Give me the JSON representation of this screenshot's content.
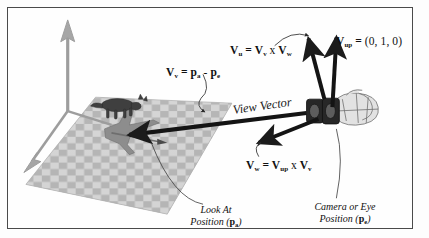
{
  "figure": {
    "kind": "camera-view-vector-diagram",
    "background": "#fefefe",
    "border_color": "#4a4a4a"
  },
  "labels": {
    "v_u": {
      "lhs": "V",
      "lhs_sub": "u",
      "eq": "=",
      "rhs1": "V",
      "rhs1_sub": "v",
      "op": "x",
      "rhs2": "V",
      "rhs2_sub": "w",
      "text": "Vu = Vv x Vw"
    },
    "v_up": {
      "lhs": "V",
      "lhs_sub": "up",
      "eq": "=",
      "value": "(0, 1, 0)",
      "text": "Vup = (0, 1, 0)"
    },
    "v_v": {
      "lhs": "V",
      "lhs_sub": "v",
      "eq": "=",
      "rhs1": "p",
      "rhs1_sub": "a",
      "op": "-",
      "rhs2": "p",
      "rhs2_sub": "e",
      "text": "Vv = pa - pe"
    },
    "v_w": {
      "lhs": "V",
      "lhs_sub": "w",
      "eq": "=",
      "rhs1": "V",
      "rhs1_sub": "up",
      "op": "x",
      "rhs2": "V",
      "rhs2_sub": "v",
      "text": "Vw = Vup x Vv"
    },
    "view_vector": "View Vector"
  },
  "captions": {
    "look_at": {
      "line1": "Look At",
      "line2_pre": "Position (",
      "symbol": "p",
      "symbol_sub": "a",
      "line2_post": ")"
    },
    "eye": {
      "line1": "Camera or Eye",
      "line2_pre": "Position (",
      "symbol": "p",
      "symbol_sub": "e",
      "line2_post": ")"
    }
  },
  "scene": {
    "ground": {
      "name": "checkerboard-ground-plane",
      "light": "#d4d4d4",
      "dark": "#b3b3b3"
    },
    "axes": {
      "name": "coordinate-axes",
      "color": "#9a9a9a",
      "count": 3
    },
    "objects": [
      {
        "name": "cat-figure",
        "color": "#4a4a4a"
      },
      {
        "name": "airplane-figure",
        "color": "#8a8a8a"
      },
      {
        "name": "camera-figure",
        "color": "#2e2e2e"
      }
    ],
    "vectors": [
      {
        "name": "view-vector-arrow",
        "label": "V_v",
        "color": "#1b1b1b"
      },
      {
        "name": "v-up-arrow",
        "label": "V_up",
        "color": "#1b1b1b"
      },
      {
        "name": "v-u-arrow",
        "label": "V_u",
        "color": "#1b1b1b"
      },
      {
        "name": "v-w-arrow",
        "label": "V_w",
        "color": "#1b1b1b"
      }
    ]
  }
}
